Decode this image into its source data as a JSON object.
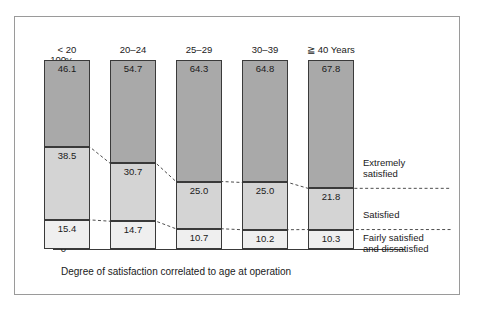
{
  "chart_data": {
    "type": "bar",
    "subtype": "stacked-100-percent",
    "title": "",
    "caption": "Degree of satisfaction correlated to age at operation",
    "xlabel": "",
    "ylabel": "%",
    "ylim": [
      0,
      100
    ],
    "yticks": [
      0,
      50,
      100
    ],
    "ytick_labels": [
      "0",
      "50",
      "100"
    ],
    "yminor_step": 10,
    "grid": false,
    "legend_position": "right",
    "categories": [
      "< 20",
      "20–24",
      "25–29",
      "30–39",
      "≧ 40 Years"
    ],
    "series": [
      {
        "name": "Extremely satisfied",
        "stack_position": "top",
        "color": "#a9a9a9",
        "values": [
          46.1,
          54.7,
          64.3,
          64.8,
          67.8
        ],
        "value_labels": [
          "46.1",
          "54.7",
          "64.3",
          "64.8",
          "67.8"
        ]
      },
      {
        "name": "Satisfied",
        "stack_position": "middle",
        "color": "#d4d4d4",
        "values": [
          38.5,
          30.7,
          25.0,
          25.0,
          21.8
        ],
        "value_labels": [
          "38.5",
          "30.7",
          "25.0",
          "25.0",
          "21.8"
        ]
      },
      {
        "name": "Fairly satisfied and dissatisfied",
        "stack_position": "bottom",
        "color": "#efefef",
        "values": [
          15.4,
          14.7,
          10.7,
          10.2,
          10.3
        ],
        "value_labels": [
          "15.4",
          "14.7",
          "10.7",
          "10.2",
          "10.3"
        ]
      }
    ],
    "legend_entries": [
      {
        "label_line1": "Extremely",
        "label_line2": "satisfied"
      },
      {
        "label_line1": "Satisfied",
        "label_line2": ""
      },
      {
        "label_line1": "Fairly satisfied",
        "label_line2": "and dissatisfied"
      }
    ],
    "annotations": {
      "axis_unit": "%",
      "connector_style": "dashed"
    },
    "colors": {
      "extremely_satisfied": "#a9a9a9",
      "satisfied": "#d4d4d4",
      "fairly_satisfied": "#efefef",
      "outline": "#3a3a3a",
      "frame": "#9a9a9a"
    }
  }
}
